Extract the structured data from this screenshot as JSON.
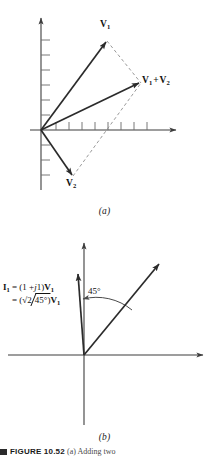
{
  "figure": {
    "panel_a": {
      "sublabel": "(a)",
      "labels": {
        "v1": "V1",
        "v2": "V2",
        "sum_first": "V1",
        "sum_op": "+",
        "sum_second": "V2"
      },
      "axis": {
        "x_tick_count": 8,
        "y_tick_count_above": 6,
        "y_tick_count_below": 4
      },
      "vectors": [
        {
          "name": "V1",
          "style": "solid",
          "from": [
            41,
            130
          ],
          "to": [
            107,
            41
          ]
        },
        {
          "name": "V1+V2",
          "style": "solid",
          "from": [
            41,
            130
          ],
          "to": [
            140,
            82
          ]
        },
        {
          "name": "V2",
          "style": "solid",
          "from": [
            41,
            130
          ],
          "to": [
            73,
            176
          ]
        },
        {
          "name": "V1-to-sum-construction",
          "style": "dashed",
          "from": [
            107,
            41
          ],
          "to": [
            140,
            82
          ]
        },
        {
          "name": "V2-to-sum-construction",
          "style": "dashed",
          "from": [
            73,
            176
          ],
          "to": [
            140,
            82
          ]
        }
      ]
    },
    "panel_b": {
      "sublabel": "(b)",
      "labels": {
        "v1": "V1",
        "angle": "45°"
      },
      "formula": {
        "line1_lhs": "I1",
        "line1_eq": "=",
        "line1_rhs_a": "(1 +",
        "line1_rhs_j": "j",
        "line1_rhs_b": "1)",
        "line1_rhs_v": "V1",
        "line2_eq": "=",
        "line2_open": "(",
        "line2_sqrt": "√2",
        "line2_angle": "45°",
        "line2_close": ")",
        "line2_v": "V1"
      },
      "vectors": [
        {
          "name": "V1",
          "style": "solid",
          "from": [
            84,
            355
          ],
          "to": [
            161,
            262
          ]
        },
        {
          "name": "I1",
          "style": "solid",
          "from": [
            84,
            355
          ],
          "to": [
            77,
            272
          ]
        }
      ]
    },
    "caption": {
      "rule": "",
      "bold": "FIGURE 10.52",
      "rest": "(a) Adding two"
    },
    "colors": {
      "ink": "#1a1a1a",
      "axis": "#3d3d3d",
      "vector": "#2b2b2b",
      "dashed": "#8a8a8a",
      "background": "#ffffff"
    }
  }
}
